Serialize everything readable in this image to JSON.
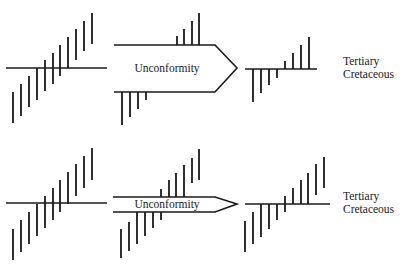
{
  "diagram": {
    "rows": [
      {
        "id": "top",
        "arrow_label": "Unconformity",
        "labels": {
          "upper": "Tertiary",
          "lower": "Cretaceous"
        },
        "arrow_style": "wide"
      },
      {
        "id": "bottom",
        "arrow_label": "Unconformity",
        "labels": {
          "upper": "Tertiary",
          "lower": "Cretaceous"
        },
        "arrow_style": "narrow"
      }
    ],
    "colors": {
      "ink": "#1a1a1a",
      "background": "#ffffff"
    }
  }
}
